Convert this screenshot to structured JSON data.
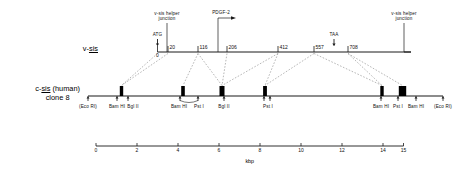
{
  "figure": {
    "type": "genomic-restriction-map",
    "rows": [
      {
        "id": "v-sis",
        "label_main": "v-",
        "label_underlined": "sis",
        "label_sub": "",
        "coordinate_unit": "nucleotide",
        "positions": [
          {
            "value": "0",
            "x": 157.5
          },
          {
            "value": "20",
            "x": 168.0
          },
          {
            "value": "116",
            "x": 198.0
          },
          {
            "value": "206",
            "x": 227.0
          },
          {
            "value": "412",
            "x": 278.0
          },
          {
            "value": "557",
            "x": 314.0
          },
          {
            "value": "708",
            "x": 348.0
          }
        ],
        "codons": [
          {
            "label": "ATG",
            "x": 157.5
          },
          {
            "label": "TAA",
            "x": 334.0
          }
        ]
      },
      {
        "id": "c-sis",
        "label_main": "c-",
        "label_underlined": "sis",
        "label_tail": " (human)",
        "label_sub": "clone 8",
        "coordinate_unit": "kbp",
        "exons": [
          {
            "x": 121.5,
            "w": 3.4
          },
          {
            "x": 183.0,
            "w": 3.6
          },
          {
            "x": 222.0,
            "w": 5.0
          },
          {
            "x": 265.0,
            "w": 3.8
          },
          {
            "x": 382.0,
            "w": 3.4
          },
          {
            "x": 402.5,
            "w": 7.4
          }
        ],
        "sites": [
          {
            "name": "(Eco RI)",
            "x": 88.0,
            "label_x": 88.0
          },
          {
            "name": "Bam HI",
            "x": 117.0,
            "label_x": 117.0
          },
          {
            "name": "Bgl II",
            "x": 128.0,
            "label_x": 133.0
          },
          {
            "name": "Bam HI",
            "x": 180.0,
            "label_x": 179.0
          },
          {
            "name": "Pst I",
            "x": 198.0,
            "label_x": 199.0
          },
          {
            "name": "Bgl II",
            "x": 224.0,
            "label_x": 224.0
          },
          {
            "name": "Pst I",
            "x": 264.0,
            "label_x": 268.0
          },
          {
            "name": "Pst I2",
            "x": 270.0,
            "label_x": -999
          },
          {
            "name": "Bam HI",
            "x": 381.0,
            "label_x": 381.0
          },
          {
            "name": "Pst I",
            "x": 398.0,
            "label_x": 398.0
          },
          {
            "name": "Bam HI",
            "x": 416.0,
            "label_x": 416.0
          },
          {
            "name": "(Eco RI)",
            "x": 443.0,
            "label_x": 443.0
          }
        ]
      }
    ],
    "annotations": [
      {
        "id": "helper-junction-left",
        "text_line1": "v-sis helper",
        "text_line2": "junction",
        "x": 167.0
      },
      {
        "id": "pdgf-2",
        "text_line1": "PDGF-2",
        "text_line2": "",
        "x": 218.0
      },
      {
        "id": "helper-junction-right",
        "text_line1": "v-sis helper",
        "text_line2": "junction",
        "x": 404.0
      }
    ],
    "scale": {
      "caption": "kbp",
      "ticks": [
        {
          "value": "0",
          "x": 96.0
        },
        {
          "value": "2",
          "x": 137.0
        },
        {
          "value": "4",
          "x": 178.0
        },
        {
          "value": "6",
          "x": 219.0
        },
        {
          "value": "8",
          "x": 260.0
        },
        {
          "value": "10",
          "x": 301.0
        },
        {
          "value": "12",
          "x": 342.0
        },
        {
          "value": "14",
          "x": 383.0
        },
        {
          "value": "15",
          "x": 403.5
        }
      ]
    },
    "colors": {
      "line": "#1a1a1a",
      "exon": "#000000",
      "dashed": "#7a7a7a",
      "text": "#111111"
    }
  }
}
